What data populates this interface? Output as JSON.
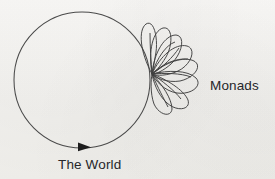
{
  "figure": {
    "kind": "hand-drawn-diagram",
    "background_color": "#f5f4f2",
    "ink_color": "#3a3a3a",
    "text_color": "#26262a"
  },
  "labels": {
    "world": "The World",
    "monads": "Monads"
  },
  "shapes": {
    "world_circle": {
      "name": "world-circle",
      "center_x": 82,
      "center_y": 80,
      "radius": 68,
      "stroke": "#4a4a4a",
      "stroke_width": 1
    },
    "direction_arrow": {
      "name": "direction-arrowhead",
      "x": 84,
      "y": 147,
      "points_toward": "right",
      "fill": "#1d1d1d"
    },
    "monad_origin": {
      "x": 152,
      "y": 74
    },
    "monad_petals": [
      {
        "id": 1,
        "angle_deg": -84,
        "length": 50,
        "width": 11,
        "tilt_deg": -6
      },
      {
        "id": 2,
        "angle_deg": -66,
        "length": 52,
        "width": 15,
        "tilt_deg": -4
      },
      {
        "id": 3,
        "angle_deg": -48,
        "length": 54,
        "width": 19,
        "tilt_deg": -2
      },
      {
        "id": 4,
        "angle_deg": -28,
        "length": 56,
        "width": 21,
        "tilt_deg": 0
      },
      {
        "id": 5,
        "angle_deg": -10,
        "length": 52,
        "width": 19,
        "tilt_deg": 2
      },
      {
        "id": 6,
        "angle_deg": 10,
        "length": 54,
        "width": 21,
        "tilt_deg": 3
      },
      {
        "id": 7,
        "angle_deg": 28,
        "length": 52,
        "width": 20,
        "tilt_deg": 4
      },
      {
        "id": 8,
        "angle_deg": 46,
        "length": 46,
        "width": 17,
        "tilt_deg": 5
      }
    ]
  }
}
